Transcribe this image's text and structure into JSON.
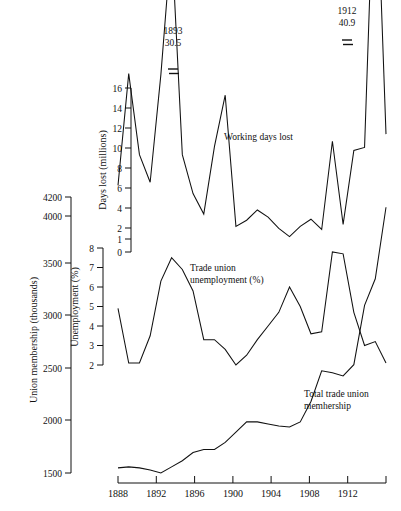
{
  "figure": {
    "background": "#ffffff",
    "line_color": "#111111"
  },
  "axes": {
    "x": {
      "label": "",
      "ticks": [
        "1888",
        "1892",
        "1896",
        "1900",
        "1904",
        "1908",
        "1912"
      ],
      "tick_values": [
        1888,
        1892,
        1896,
        1900,
        1904,
        1908,
        1912
      ],
      "range": [
        1888,
        1913
      ]
    },
    "days_lost": {
      "title": "Days lost (millions)",
      "ticks": [
        "16",
        "14",
        "12",
        "10",
        "8",
        "6",
        "4",
        "2",
        "1",
        "0"
      ],
      "tick_values": [
        16,
        14,
        12,
        10,
        8,
        6,
        4,
        2,
        1,
        0
      ],
      "range": [
        0,
        17
      ]
    },
    "unemployment": {
      "title": "Unemployment (%)",
      "ticks": [
        "8",
        "7",
        "6",
        "5",
        "4",
        "3",
        "2"
      ],
      "tick_values": [
        8,
        7,
        6,
        5,
        4,
        3,
        2
      ],
      "range": [
        2,
        8
      ]
    },
    "membership": {
      "title": "Union membership (thousands)",
      "ticks": [
        "4200",
        "4000",
        "3500",
        "3000",
        "2500",
        "2000",
        "1500"
      ],
      "tick_values": [
        4200,
        4000,
        3500,
        3000,
        2500,
        2000,
        1500
      ],
      "range": [
        1500,
        4200
      ]
    }
  },
  "annotations": {
    "working_days_lost": "Working days lost",
    "trade_union_unemployment_line1": "Trade union",
    "trade_union_unemployment_line2": "unemployment (%)",
    "total_membership_line1": "Total trade union",
    "total_membership_line2": "memhership",
    "peak_1893_year": "1893",
    "peak_1893_value": "30.5",
    "peak_1912_year": "1912",
    "peak_1912_value": "40.9"
  },
  "chart_data": {
    "type": "line",
    "title": "",
    "xlabel": "",
    "ylabel": "",
    "grid": false,
    "legend": "inline-annotations",
    "x": [
      1888,
      1889,
      1890,
      1891,
      1892,
      1893,
      1894,
      1895,
      1896,
      1897,
      1898,
      1899,
      1900,
      1901,
      1902,
      1903,
      1904,
      1905,
      1906,
      1907,
      1908,
      1909,
      1910,
      1911,
      1912,
      1913
    ],
    "series": [
      {
        "name": "Working days lost",
        "unit": "millions",
        "axis": "days_lost",
        "ylim": [
          0,
          17
        ],
        "values": [
          6.5,
          17.4,
          9.5,
          6.8,
          17.3,
          30.5,
          9.5,
          5.7,
          3.7,
          10.3,
          15.3,
          2.5,
          3.1,
          4.1,
          3.4,
          2.3,
          1.5,
          2.5,
          3.2,
          2.2,
          10.8,
          2.7,
          9.9,
          10.2,
          40.9,
          11.5
        ],
        "annotated_peaks": [
          {
            "x": 1893,
            "value": 30.5,
            "label": "1893\n30.5",
            "axis_break": true
          },
          {
            "x": 1912,
            "value": 40.9,
            "label": "1912\n40.9",
            "axis_break": true
          }
        ]
      },
      {
        "name": "Trade union unemployment (%)",
        "unit": "percent",
        "axis": "unemployment",
        "ylim": [
          2,
          8
        ],
        "values": [
          4.9,
          2.1,
          2.1,
          3.5,
          6.3,
          7.5,
          6.9,
          5.8,
          3.3,
          3.3,
          2.8,
          2.0,
          2.5,
          3.3,
          4.0,
          4.7,
          6.0,
          5.0,
          3.6,
          3.7,
          7.8,
          7.7,
          4.7,
          3.0,
          3.2,
          2.1
        ],
        "end_value": 3.3
      },
      {
        "name": "Total trade union membership",
        "unit": "thousands",
        "axis": "membership",
        "ylim": [
          1500,
          4200
        ],
        "values": [
          1550,
          1560,
          1550,
          1530,
          1500,
          1560,
          1620,
          1700,
          1730,
          1730,
          1800,
          1900,
          2000,
          2000,
          1980,
          1960,
          1950,
          2000,
          2200,
          2500,
          2480,
          2450,
          2560,
          3140,
          3400,
          4100
        ]
      }
    ]
  }
}
